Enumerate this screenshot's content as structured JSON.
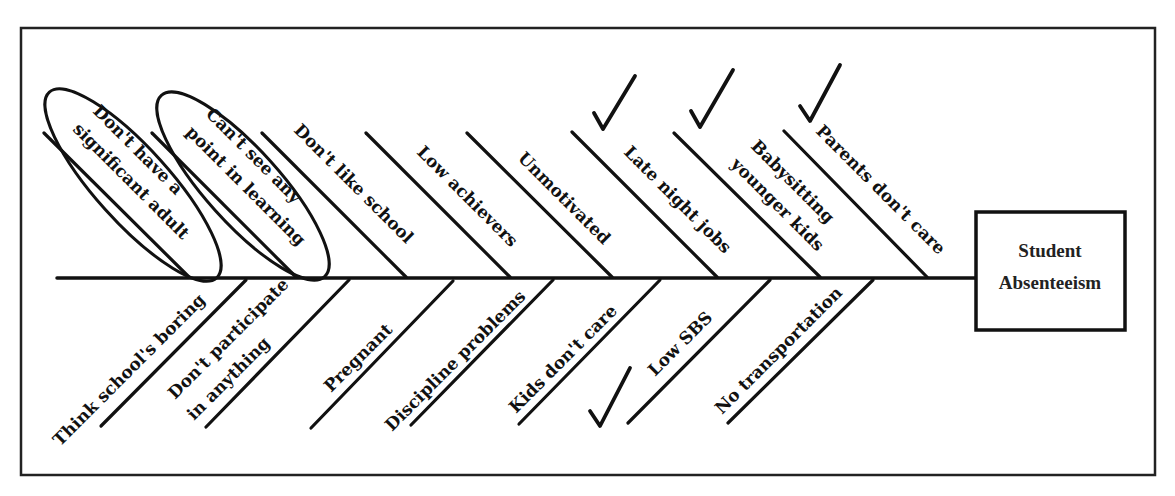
{
  "diagram": {
    "type": "fishbone",
    "effect": {
      "label_lines": [
        "Student",
        "Absenteeism"
      ]
    },
    "upper_causes": [
      {
        "lines": [
          "Don't have a",
          "significant adult"
        ],
        "circled": true,
        "checked": false
      },
      {
        "lines": [
          "Can't see any",
          "point in learning"
        ],
        "circled": true,
        "checked": false
      },
      {
        "lines": [
          "Don't like school"
        ],
        "circled": false,
        "checked": false
      },
      {
        "lines": [
          "Low achievers"
        ],
        "circled": false,
        "checked": false
      },
      {
        "lines": [
          "Unmotivated"
        ],
        "circled": false,
        "checked": false
      },
      {
        "lines": [
          "Late night jobs"
        ],
        "circled": false,
        "checked": true
      },
      {
        "lines": [
          "Babysitting",
          "younger kids"
        ],
        "circled": false,
        "checked": true
      },
      {
        "lines": [
          "Parents don't care"
        ],
        "circled": false,
        "checked": true
      }
    ],
    "lower_causes": [
      {
        "lines": [
          "Think school's boring"
        ],
        "checked": false
      },
      {
        "lines": [
          "Don't participate",
          "in anything"
        ],
        "checked": false
      },
      {
        "lines": [
          "Pregnant"
        ],
        "checked": false
      },
      {
        "lines": [
          "Discipline problems"
        ],
        "checked": false
      },
      {
        "lines": [
          "Kids don't care"
        ],
        "checked": false
      },
      {
        "lines": [
          "Low SBS"
        ],
        "checked": true
      },
      {
        "lines": [
          "No transportation"
        ],
        "checked": false
      }
    ],
    "colors": {
      "ink": "#111111",
      "background": "#ffffff"
    }
  }
}
